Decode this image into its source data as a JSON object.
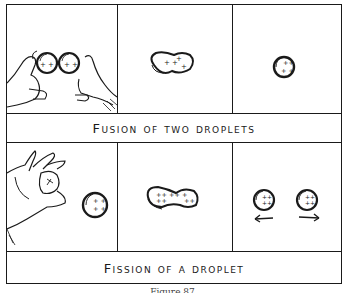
{
  "figure": {
    "top_section": {
      "title": "Fusion of two droplets",
      "panels": [
        {
          "description": "Two hands pushing two charged droplets together"
        },
        {
          "description": "Droplets merged into a peanut-shaped drop"
        },
        {
          "description": "Single fused round droplet"
        }
      ]
    },
    "bottom_section": {
      "title": "Fission of a droplet",
      "panels": [
        {
          "description": "Hand flicking a single charged droplet"
        },
        {
          "description": "Droplet elongating into a peanut shape"
        },
        {
          "description": "Two droplets moving apart",
          "arrows": [
            "left-arrow",
            "right-arrow"
          ]
        }
      ]
    },
    "charge_symbol": "+",
    "caption": "Figure 87",
    "colors": {
      "ink": "#1a1a1a",
      "paper": "#ffffff"
    }
  }
}
